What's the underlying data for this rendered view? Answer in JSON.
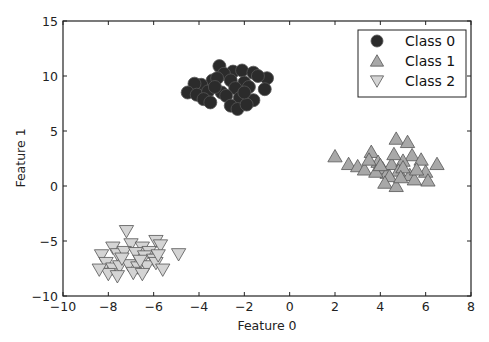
{
  "chart_data": {
    "type": "scatter",
    "title": "",
    "xlabel": "Feature 0",
    "ylabel": "Feature 1",
    "xlim": [
      -10,
      8
    ],
    "ylim": [
      -10,
      15
    ],
    "xticks": [
      -10,
      -8,
      -6,
      -4,
      -2,
      0,
      2,
      4,
      6,
      8
    ],
    "yticks": [
      -10,
      -5,
      0,
      5,
      10,
      15
    ],
    "grid": false,
    "legend_position": "upper right",
    "series": [
      {
        "name": "Class 0",
        "marker": "circle",
        "color": "#2b2b2b",
        "points": [
          [
            -3.1,
            10.9
          ],
          [
            -2.5,
            10.4
          ],
          [
            -2.1,
            10.5
          ],
          [
            -1.6,
            10.3
          ],
          [
            -1.0,
            9.8
          ],
          [
            -1.4,
            10.0
          ],
          [
            -2.9,
            10.2
          ],
          [
            -3.4,
            9.6
          ],
          [
            -3.9,
            9.2
          ],
          [
            -4.2,
            9.3
          ],
          [
            -3.2,
            9.8
          ],
          [
            -2.6,
            9.6
          ],
          [
            -2.0,
            9.4
          ],
          [
            -1.8,
            9.0
          ],
          [
            -1.1,
            8.8
          ],
          [
            -4.5,
            8.5
          ],
          [
            -4.1,
            8.3
          ],
          [
            -3.6,
            8.6
          ],
          [
            -3.0,
            8.5
          ],
          [
            -2.4,
            8.9
          ],
          [
            -2.8,
            8.2
          ],
          [
            -2.2,
            8.0
          ],
          [
            -1.6,
            7.8
          ],
          [
            -3.8,
            7.9
          ],
          [
            -3.5,
            7.6
          ],
          [
            -2.6,
            7.3
          ],
          [
            -2.3,
            7.0
          ],
          [
            -1.9,
            7.4
          ],
          [
            -3.3,
            9.0
          ],
          [
            -2.0,
            8.5
          ]
        ]
      },
      {
        "name": "Class 1",
        "marker": "triangle-up",
        "color": "#a8a8a8",
        "points": [
          [
            2.0,
            2.7
          ],
          [
            2.6,
            2.0
          ],
          [
            3.0,
            1.8
          ],
          [
            3.3,
            1.5
          ],
          [
            3.6,
            3.1
          ],
          [
            3.9,
            2.2
          ],
          [
            4.1,
            1.6
          ],
          [
            4.3,
            1.2
          ],
          [
            4.5,
            2.0
          ],
          [
            4.7,
            4.3
          ],
          [
            5.2,
            4.0
          ],
          [
            5.4,
            2.8
          ],
          [
            5.0,
            2.3
          ],
          [
            4.8,
            1.4
          ],
          [
            4.4,
            0.9
          ],
          [
            4.2,
            0.3
          ],
          [
            4.7,
            0.0
          ],
          [
            5.3,
            1.0
          ],
          [
            5.8,
            2.4
          ],
          [
            6.0,
            1.3
          ],
          [
            6.5,
            2.0
          ],
          [
            6.1,
            0.5
          ],
          [
            5.5,
            0.6
          ],
          [
            3.8,
            1.3
          ],
          [
            4.0,
            1.9
          ],
          [
            4.6,
            2.9
          ],
          [
            5.0,
            1.7
          ],
          [
            3.5,
            2.4
          ],
          [
            4.9,
            0.8
          ],
          [
            5.6,
            1.5
          ]
        ]
      },
      {
        "name": "Class 2",
        "marker": "triangle-down",
        "color": "#d4d4d4",
        "points": [
          [
            -7.2,
            -4.1
          ],
          [
            -5.9,
            -5.0
          ],
          [
            -7.8,
            -5.6
          ],
          [
            -7.0,
            -5.3
          ],
          [
            -6.5,
            -5.6
          ],
          [
            -6.2,
            -6.0
          ],
          [
            -5.7,
            -5.4
          ],
          [
            -4.9,
            -6.2
          ],
          [
            -8.3,
            -6.3
          ],
          [
            -7.6,
            -6.2
          ],
          [
            -7.3,
            -6.0
          ],
          [
            -6.8,
            -6.1
          ],
          [
            -6.4,
            -6.4
          ],
          [
            -6.0,
            -6.7
          ],
          [
            -8.1,
            -7.0
          ],
          [
            -7.8,
            -7.5
          ],
          [
            -7.5,
            -7.3
          ],
          [
            -7.1,
            -7.2
          ],
          [
            -6.7,
            -7.4
          ],
          [
            -6.3,
            -7.3
          ],
          [
            -5.9,
            -7.0
          ],
          [
            -5.6,
            -7.6
          ],
          [
            -8.0,
            -8.0
          ],
          [
            -7.6,
            -8.2
          ],
          [
            -6.9,
            -7.9
          ],
          [
            -6.5,
            -8.0
          ],
          [
            -7.4,
            -6.6
          ],
          [
            -6.6,
            -6.8
          ],
          [
            -8.4,
            -7.6
          ],
          [
            -5.8,
            -6.3
          ]
        ]
      }
    ]
  }
}
